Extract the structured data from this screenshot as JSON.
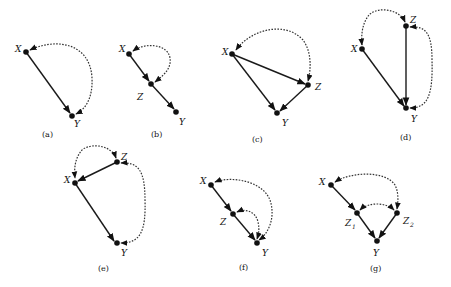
{
  "figure": {
    "panels": [
      {
        "id": "a",
        "caption": "(a)",
        "nodes": [
          "X",
          "Y"
        ],
        "directed_edges": [
          [
            "X",
            "Y"
          ]
        ],
        "bidirected_edges": [
          [
            "X",
            "Y"
          ]
        ]
      },
      {
        "id": "b",
        "caption": "(b)",
        "nodes": [
          "X",
          "Z",
          "Y"
        ],
        "directed_edges": [
          [
            "X",
            "Z"
          ],
          [
            "Z",
            "Y"
          ]
        ],
        "bidirected_edges": [
          [
            "X",
            "Z"
          ]
        ]
      },
      {
        "id": "c",
        "caption": "(c)",
        "nodes": [
          "X",
          "Z",
          "Y"
        ],
        "directed_edges": [
          [
            "X",
            "Z"
          ],
          [
            "X",
            "Y"
          ],
          [
            "Z",
            "Y"
          ]
        ],
        "bidirected_edges": [
          [
            "X",
            "Z"
          ]
        ]
      },
      {
        "id": "d",
        "caption": "(d)",
        "nodes": [
          "Z",
          "X",
          "Y"
        ],
        "directed_edges": [
          [
            "Z",
            "Y"
          ],
          [
            "X",
            "Y"
          ]
        ],
        "bidirected_edges": [
          [
            "Z",
            "X"
          ],
          [
            "Z",
            "Y"
          ]
        ]
      },
      {
        "id": "e",
        "caption": "(e)",
        "nodes": [
          "Z",
          "X",
          "Y"
        ],
        "directed_edges": [
          [
            "Z",
            "X"
          ],
          [
            "X",
            "Y"
          ]
        ],
        "bidirected_edges": [
          [
            "Z",
            "X"
          ],
          [
            "Z",
            "Y"
          ]
        ]
      },
      {
        "id": "f",
        "caption": "(f)",
        "nodes": [
          "X",
          "Z",
          "Y"
        ],
        "directed_edges": [
          [
            "X",
            "Z"
          ],
          [
            "Z",
            "Y"
          ]
        ],
        "bidirected_edges": [
          [
            "X",
            "Y"
          ],
          [
            "Z",
            "Y"
          ]
        ]
      },
      {
        "id": "g",
        "caption": "(g)",
        "nodes": [
          "X",
          "Z1",
          "Z2",
          "Y"
        ],
        "directed_edges": [
          [
            "X",
            "Z1"
          ],
          [
            "Z1",
            "Y"
          ],
          [
            "Z2",
            "Y"
          ]
        ],
        "bidirected_edges": [
          [
            "X",
            "Z2"
          ],
          [
            "Z1",
            "Z2"
          ]
        ]
      }
    ]
  },
  "labels": {
    "a": {
      "X": "X",
      "Y": "Y",
      "cap": "(a)"
    },
    "b": {
      "X": "X",
      "Z": "Z",
      "Y": "Y",
      "cap": "(b)"
    },
    "c": {
      "X": "X",
      "Z": "Z",
      "Y": "Y",
      "cap": "(c)"
    },
    "d": {
      "X": "X",
      "Z": "Z",
      "Y": "Y",
      "cap": "(d)"
    },
    "e": {
      "X": "X",
      "Z": "Z",
      "Y": "Y",
      "cap": "(e)"
    },
    "f": {
      "X": "X",
      "Z": "Z",
      "Y": "Y",
      "cap": "(f)"
    },
    "g": {
      "X": "X",
      "Z1": "Z",
      "Z1sub": "1",
      "Z2": "Z",
      "Z2sub": "2",
      "Y": "Y",
      "cap": "(g)"
    }
  }
}
